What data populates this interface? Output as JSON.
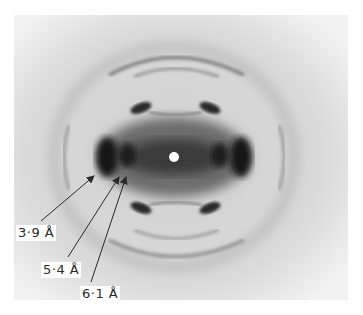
{
  "figure": {
    "colors": {
      "background": "#dcdcdc",
      "dark_spot": "#1a1a1a",
      "center_spot": "#ffffff"
    },
    "annotations": [
      {
        "label": "3·9 Å"
      },
      {
        "label": "5·4 Å"
      },
      {
        "label": "6·1 Å"
      }
    ]
  }
}
